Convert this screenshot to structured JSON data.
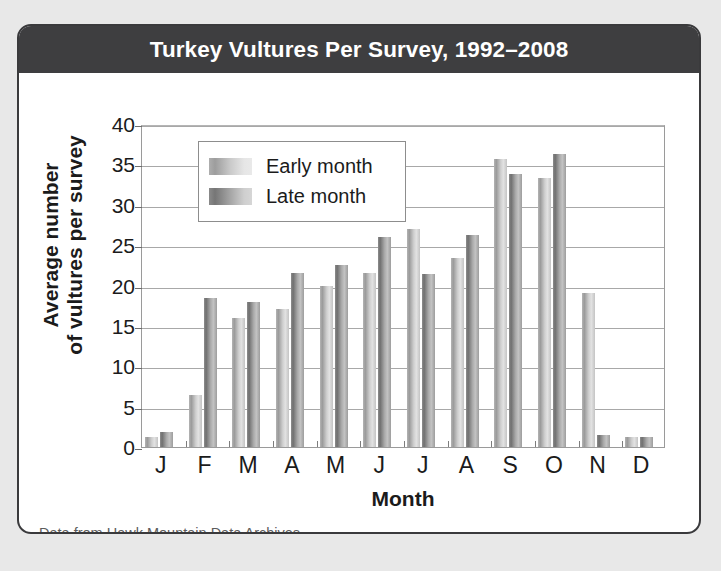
{
  "card": {
    "title": "Turkey Vultures Per Survey, 1992–2008",
    "source_note": "Data from Hawk Mountain Data Archives"
  },
  "chart_data": {
    "type": "bar",
    "title": "Turkey Vultures Per Survey, 1992–2008",
    "xlabel": "Month",
    "ylabel": "Average number\nof vultures per survey",
    "ylabel_line1": "Average number",
    "ylabel_line2": "of vultures per survey",
    "categories": [
      "J",
      "F",
      "M",
      "A",
      "M",
      "J",
      "J",
      "A",
      "S",
      "O",
      "N",
      "D"
    ],
    "category_full_names": [
      "January",
      "February",
      "March",
      "April",
      "May",
      "June",
      "July",
      "August",
      "September",
      "October",
      "November",
      "December"
    ],
    "series": [
      {
        "name": "Early month",
        "color": "#cbcbcb",
        "values": [
          1.2,
          6.5,
          16.0,
          17.1,
          20.0,
          21.5,
          27.0,
          23.4,
          35.7,
          33.3,
          19.1,
          1.2
        ]
      },
      {
        "name": "Late month",
        "color": "#a4a4a4",
        "values": [
          1.8,
          18.5,
          17.9,
          21.5,
          22.5,
          26.0,
          21.4,
          26.2,
          33.8,
          36.3,
          1.5,
          1.2
        ]
      }
    ],
    "ylim": [
      0,
      40
    ],
    "yticks": [
      0,
      5,
      10,
      15,
      20,
      25,
      30,
      35,
      40
    ],
    "ytick_labels": [
      "0",
      "5",
      "10",
      "15",
      "20",
      "25",
      "30",
      "35",
      "40"
    ],
    "grid": true,
    "grid_axis": "y",
    "legend_position": "upper left",
    "legend_entries": [
      "Early month",
      "Late month"
    ]
  },
  "colors": {
    "banner_background": "#3e3e40",
    "banner_text": "#ffffff",
    "card_border": "#3a3a3c",
    "page_background": "#e8e8e8",
    "plot_background": "#ffffff",
    "gridline": "#a8a8a8",
    "axis_text": "#1b1b1b",
    "source_text": "#5c5c5c"
  }
}
